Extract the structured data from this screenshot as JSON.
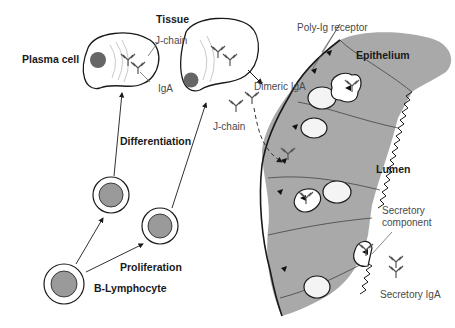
{
  "diagram": {
    "type": "biological-process",
    "colors": {
      "epithelium_fill": "#a9a9a9",
      "nucleus_fill": "#9a9a9a",
      "plasma_nucleus_fill": "#666666",
      "outline": "#1a1a1a",
      "label_thin": "#4a4a4a",
      "background": "#ffffff"
    },
    "labels": {
      "tissue": "Tissue",
      "plasma_cell": "Plasma cell",
      "j_chain_top": "J-chain",
      "iga": "IgA",
      "differentiation": "Differentiation",
      "dimeric_iga": "Dimeric IgA",
      "j_chain_mid": "J-chain",
      "poly_ig_receptor": "Poly-Ig receptor",
      "epithelium": "Epithelium",
      "lumen": "Lumen",
      "secretory_component_line1": "Secretory",
      "secretory_component_line2": "component",
      "secretory_iga": "Secretory IgA",
      "proliferation": "Proliferation",
      "b_lymphocyte": "B-Lymphocyte"
    },
    "nodes": [
      {
        "id": "b-lymphocyte",
        "label": "B-Lymphocyte"
      },
      {
        "id": "proliferated-cell-1",
        "label": ""
      },
      {
        "id": "proliferated-cell-2",
        "label": ""
      },
      {
        "id": "plasma-cell-1",
        "label": "Plasma cell"
      },
      {
        "id": "plasma-cell-2",
        "label": ""
      },
      {
        "id": "dimeric-iga",
        "label": "Dimeric IgA"
      },
      {
        "id": "epithelium",
        "label": "Epithelium"
      },
      {
        "id": "secretory-iga",
        "label": "Secretory IgA"
      }
    ],
    "edges": [
      {
        "from": "b-lymphocyte",
        "to": "proliferated-cell-1",
        "label": "Proliferation"
      },
      {
        "from": "b-lymphocyte",
        "to": "proliferated-cell-2",
        "label": "Proliferation"
      },
      {
        "from": "proliferated-cell-1",
        "to": "plasma-cell-1",
        "label": "Differentiation"
      },
      {
        "from": "proliferated-cell-2",
        "to": "plasma-cell-2",
        "label": "Differentiation"
      },
      {
        "from": "plasma-cell-2",
        "to": "dimeric-iga",
        "label": ""
      },
      {
        "from": "dimeric-iga",
        "to": "epithelium",
        "label": "",
        "style": "dashed"
      },
      {
        "from": "epithelium",
        "to": "secretory-iga",
        "label": ""
      }
    ]
  }
}
